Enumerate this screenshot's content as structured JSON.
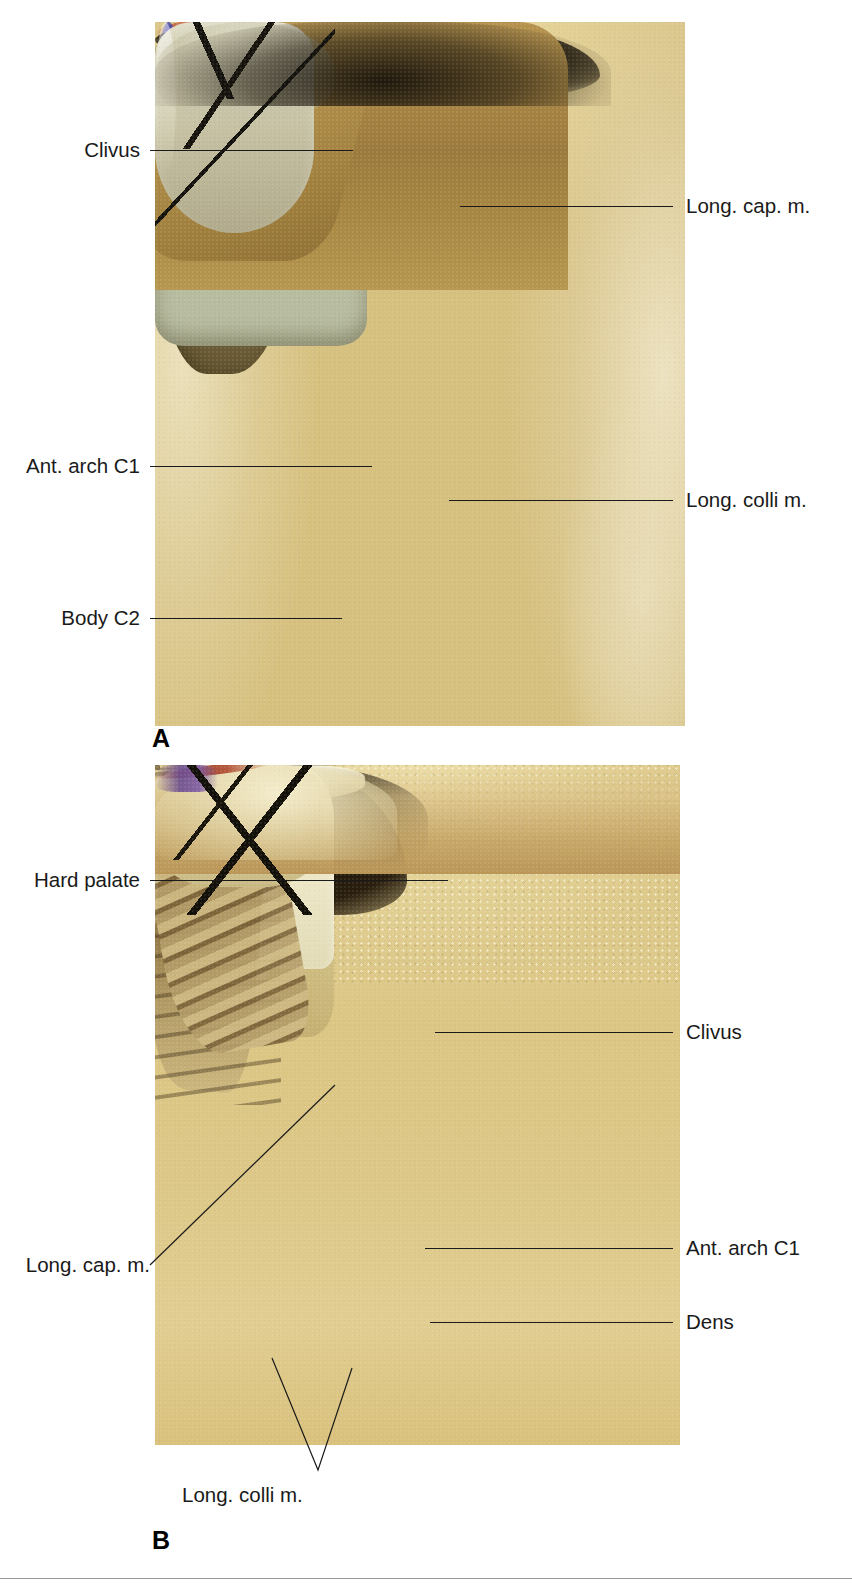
{
  "figure": {
    "panels": [
      {
        "id": "A",
        "letter": "A",
        "labels": [
          {
            "key": "clivus",
            "text": "Clivus",
            "side": "left"
          },
          {
            "key": "long_cap",
            "text": "Long. cap. m.",
            "side": "right"
          },
          {
            "key": "ant_arch_c1",
            "text": "Ant. arch C1",
            "side": "left"
          },
          {
            "key": "long_colli",
            "text": "Long. colli m.",
            "side": "right"
          },
          {
            "key": "body_c2",
            "text": "Body C2",
            "side": "left"
          }
        ]
      },
      {
        "id": "B",
        "letter": "B",
        "labels": [
          {
            "key": "hard_palate",
            "text": "Hard palate",
            "side": "left"
          },
          {
            "key": "clivus",
            "text": "Clivus",
            "side": "right"
          },
          {
            "key": "long_cap",
            "text": "Long. cap. m.",
            "side": "left"
          },
          {
            "key": "ant_arch_c1",
            "text": "Ant. arch C1",
            "side": "right"
          },
          {
            "key": "dens",
            "text": "Dens",
            "side": "right"
          },
          {
            "key": "long_colli",
            "text": "Long. colli m.",
            "side": "bottom"
          }
        ]
      }
    ]
  },
  "colors": {
    "background": "#ffffff",
    "label_text": "#1a1a1a",
    "leader_line": "#1a1a1a",
    "rule": "#9a9a9a"
  }
}
